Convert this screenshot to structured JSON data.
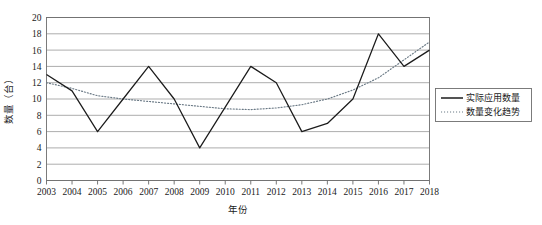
{
  "chart_data": {
    "type": "line",
    "title": "",
    "xlabel": "年份",
    "ylabel": "数量（台）",
    "grid": "horizontal",
    "legend_position": "right-middle",
    "categories": [
      "2003",
      "2004",
      "2005",
      "2006",
      "2007",
      "2008",
      "2009",
      "2010",
      "2011",
      "2012",
      "2013",
      "2014",
      "2015",
      "2016",
      "2017",
      "2018"
    ],
    "xlim": [
      2003,
      2018
    ],
    "ylim": [
      0,
      20
    ],
    "yticks": [
      0,
      2,
      4,
      6,
      8,
      10,
      12,
      14,
      16,
      18,
      20
    ],
    "series": [
      {
        "name": "实际应用数量",
        "style": "solid",
        "color": "#1b1b1b",
        "values": [
          13,
          11,
          6,
          10,
          14,
          10,
          4,
          9,
          14,
          12,
          6,
          7,
          10,
          18,
          14,
          16
        ]
      },
      {
        "name": "数量变化趋势",
        "style": "dotted",
        "color": "#6b7a86",
        "values": [
          12.0,
          11.3,
          10.4,
          10.0,
          9.7,
          9.4,
          9.1,
          8.8,
          8.7,
          8.9,
          9.3,
          10.0,
          11.1,
          12.6,
          14.8,
          17.0
        ]
      }
    ]
  },
  "legend": {
    "items": [
      {
        "label": "实际应用数量",
        "swatch": "solid-line-swatch"
      },
      {
        "label": "数量变化趋势",
        "swatch": "dotted-line-swatch"
      }
    ]
  },
  "axes": {
    "y_title": "数量（台）",
    "x_title": "年份",
    "y_tick_labels": [
      "20",
      "18",
      "16",
      "14",
      "12",
      "10",
      "8",
      "6",
      "4",
      "2",
      "0"
    ],
    "x_tick_labels": [
      "2003",
      "2004",
      "2005",
      "2006",
      "2007",
      "2008",
      "2009",
      "2010",
      "2011",
      "2012",
      "2013",
      "2014",
      "2015",
      "2016",
      "2017",
      "2018"
    ]
  }
}
